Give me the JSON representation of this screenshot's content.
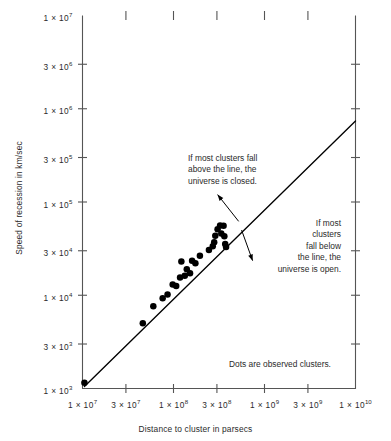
{
  "chart_data": {
    "type": "scatter",
    "title": "",
    "xlabel": "Distance to cluster in parsecs",
    "ylabel": "Speed of recession in km/sec",
    "xscale": "log",
    "yscale": "log",
    "xlim": [
      10000000.0,
      10000000000.0
    ],
    "ylim": [
      1000.0,
      10000000.0
    ],
    "grid": false,
    "legend": null,
    "xticks": [
      {
        "value": 10000000.0,
        "label": "1 × 10",
        "exp": "7"
      },
      {
        "value": 30000000.0,
        "label": "3 × 10",
        "exp": "7"
      },
      {
        "value": 100000000.0,
        "label": "1 × 10",
        "exp": "8"
      },
      {
        "value": 300000000.0,
        "label": "3 × 10",
        "exp": "8"
      },
      {
        "value": 1000000000.0,
        "label": "1 × 10",
        "exp": "9"
      },
      {
        "value": 3000000000.0,
        "label": "3 × 10",
        "exp": "9"
      },
      {
        "value": 10000000000.0,
        "label": "1 × 10",
        "exp": "10"
      }
    ],
    "yticks": [
      {
        "value": 10000000.0,
        "label": "1 × 10",
        "exp": "7"
      },
      {
        "value": 3000000.0,
        "label": "3 × 10",
        "exp": "6"
      },
      {
        "value": 1000000.0,
        "label": "1 × 10",
        "exp": "6"
      },
      {
        "value": 300000.0,
        "label": "3 × 10",
        "exp": "5"
      },
      {
        "value": 100000.0,
        "label": "1 × 10",
        "exp": "5"
      },
      {
        "value": 30000.0,
        "label": "3 × 10",
        "exp": "4"
      },
      {
        "value": 10000.0,
        "label": "1 × 10",
        "exp": "4"
      },
      {
        "value": 3000.0,
        "label": "3 × 10",
        "exp": "3"
      },
      {
        "value": 1000.0,
        "label": "1 × 10",
        "exp": "3"
      }
    ],
    "series": [
      {
        "name": "Observed clusters",
        "marker": "filled-circle",
        "color": "#000000",
        "points": [
          {
            "x": 10500000.0,
            "y": 1150.0
          },
          {
            "x": 46000000.0,
            "y": 5000.0
          },
          {
            "x": 60000000.0,
            "y": 7600.0
          },
          {
            "x": 76000000.0,
            "y": 9300.0
          },
          {
            "x": 86000000.0,
            "y": 10200.0
          },
          {
            "x": 98000000.0,
            "y": 13000.0
          },
          {
            "x": 107000000.0,
            "y": 12600.0
          },
          {
            "x": 118000000.0,
            "y": 15500.0
          },
          {
            "x": 122000000.0,
            "y": 23000.0
          },
          {
            "x": 133000000.0,
            "y": 16200.0
          },
          {
            "x": 140000000.0,
            "y": 19000.0
          },
          {
            "x": 152000000.0,
            "y": 17200.0
          },
          {
            "x": 160000000.0,
            "y": 23500.0
          },
          {
            "x": 174000000.0,
            "y": 22000.0
          },
          {
            "x": 195000000.0,
            "y": 26500.0
          },
          {
            "x": 245000000.0,
            "y": 30500.0
          },
          {
            "x": 270000000.0,
            "y": 33500.0
          },
          {
            "x": 280000000.0,
            "y": 37000.0
          },
          {
            "x": 288000000.0,
            "y": 43500.0
          },
          {
            "x": 305000000.0,
            "y": 51000.0
          },
          {
            "x": 325000000.0,
            "y": 56000.0
          },
          {
            "x": 335000000.0,
            "y": 46000.0
          },
          {
            "x": 355000000.0,
            "y": 55500.0
          },
          {
            "x": 362000000.0,
            "y": 43000.0
          },
          {
            "x": 370000000.0,
            "y": 35500.0
          },
          {
            "x": 378000000.0,
            "y": 33000.0
          }
        ]
      }
    ],
    "fit_line": {
      "name": "Hubble relation",
      "color": "#000000",
      "from": {
        "x": 10500000.0,
        "y": 1050.0
      },
      "to": {
        "x": 10000000000.0,
        "y": 740000.0
      }
    },
    "annotations": [
      {
        "id": "closed",
        "text": "If most clusters fall\nabove the line, the\nuniverse is closed.",
        "align": "left",
        "arrow": {
          "from": {
            "x": 305000000.0,
            "y": 120000.0
          },
          "to": {
            "x": 520000000.0,
            "y": 62000.0
          }
        }
      },
      {
        "id": "open",
        "text": "If most\nclusters\nfall below\nthe line, the\nuniverse is open.",
        "align": "right",
        "arrow": {
          "from": {
            "x": 740000000.0,
            "y": 23500.0
          },
          "to": {
            "x": 560000000.0,
            "y": 50000.0
          }
        }
      },
      {
        "id": "dots",
        "text": "Dots are observed clusters.",
        "align": "left",
        "arrow": null
      }
    ]
  }
}
